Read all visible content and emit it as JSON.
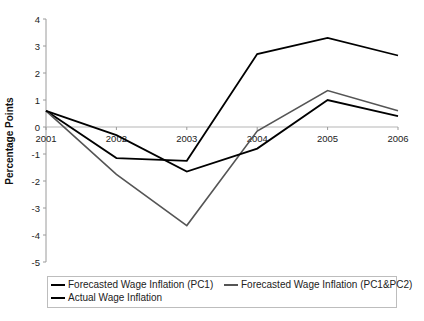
{
  "chart_data": {
    "type": "line",
    "title": "",
    "xlabel": "",
    "ylabel": "Percentage Points",
    "x": [
      "2001",
      "2002",
      "2003",
      "2004",
      "2005",
      "2006"
    ],
    "ylim": [
      -5,
      4
    ],
    "yticks": [
      4,
      3,
      2,
      1,
      0,
      -1,
      -2,
      -3,
      -4,
      -5
    ],
    "grid": false,
    "legend_position": "bottom",
    "series": [
      {
        "name": "Forecasted Wage Inflation (PC1)",
        "color": "#000000",
        "values": [
          0.6,
          -1.15,
          -1.25,
          2.7,
          3.3,
          2.65
        ]
      },
      {
        "name": "Forecasted Wage Inflation (PC1&PC2)",
        "color": "#555555",
        "values": [
          0.6,
          -1.75,
          -3.65,
          -0.15,
          1.35,
          0.6
        ]
      },
      {
        "name": "Actual Wage Inflation",
        "color": "#000000",
        "values": [
          0.6,
          -0.3,
          -1.65,
          -0.8,
          1.0,
          0.4
        ]
      }
    ]
  },
  "legend": {
    "items": [
      {
        "label": "Forecasted Wage Inflation (PC1)"
      },
      {
        "label": "Forecasted Wage Inflation (PC1&PC2)"
      },
      {
        "label": "Actual Wage Inflation"
      }
    ]
  }
}
